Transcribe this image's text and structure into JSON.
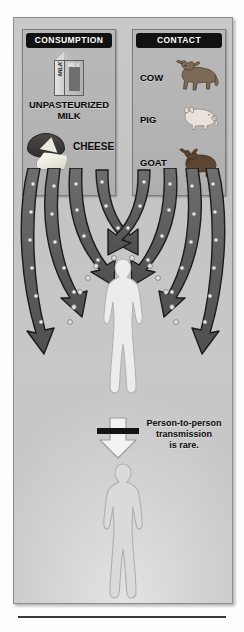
{
  "poster": {
    "title_hidden": "",
    "background_color": "#c5c5c5",
    "border_color": "#8d8d8d"
  },
  "cards": [
    {
      "id": "consumption",
      "header": "CONSUMPTION",
      "header_bg": "#111111",
      "header_color": "#ffffff",
      "items": [
        {
          "name": "unpasteurized-milk",
          "label_line1": "UNPASTEURIZED",
          "label_line2": "MILK",
          "art": "milk-carton-icon",
          "art_text_side": "MILK",
          "art_text_front": "MILK"
        },
        {
          "name": "cheese",
          "label_line1": "CHEESE",
          "label_line2": "",
          "art": "cheese-wheel-icon"
        }
      ]
    },
    {
      "id": "contact",
      "header": "CONTACT",
      "header_bg": "#111111",
      "header_color": "#ffffff",
      "items": [
        {
          "name": "cow",
          "label_line1": "COW",
          "label_line2": "",
          "art": "cow-icon",
          "art_color": "#7d6a55"
        },
        {
          "name": "pig",
          "label_line1": "PIG",
          "label_line2": "",
          "art": "pig-icon",
          "art_color": "#e6dcd6"
        },
        {
          "name": "goat",
          "label_line1": "GOAT",
          "label_line2": "",
          "art": "goat-icon",
          "art_color": "#5d4631"
        }
      ]
    }
  ],
  "transmission": {
    "arrow_count": 8,
    "arrow_color": "#5e5e5e",
    "arrow_outline": "#1c1c1c",
    "germ_color": "#e9e9e9",
    "germ_outline": "#6d6d6d",
    "direction": "downward-converging"
  },
  "figures": {
    "primary": {
      "name": "infected-person",
      "fill": "#e9e9e9",
      "outline": "#b4b4b4"
    },
    "secondary": {
      "name": "second-person",
      "fill": "#d7d7d7",
      "outline": "#b0b0b0"
    }
  },
  "note": {
    "icon": "blocked-down-arrow-icon",
    "line1": "Person-to-person",
    "line2": "transmission",
    "line3": "is rare.",
    "arrow_fill": "#f2f2f2",
    "bar_color": "#141414"
  },
  "footer": {
    "rule_color": "#3a3a3a"
  }
}
